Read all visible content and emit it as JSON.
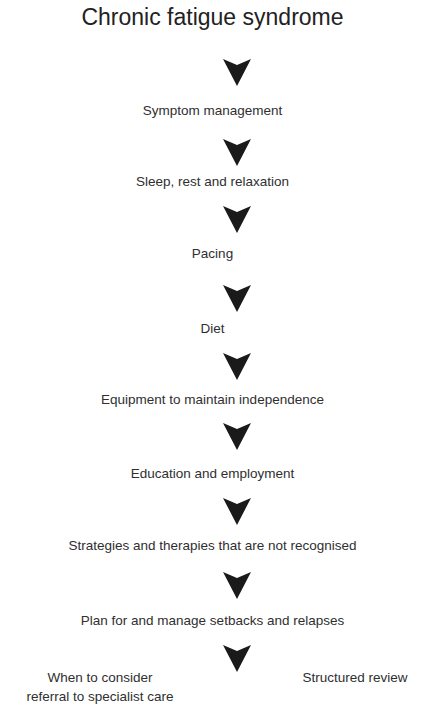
{
  "title": "Chronic fatigue syndrome",
  "steps": [
    "Symptom management",
    "Sleep, rest and relaxation",
    "Pacing",
    "Diet",
    "Equipment to maintain independence",
    "Education and employment",
    "Strategies and therapies that are not recognised",
    "Plan for and manage setbacks and relapses"
  ],
  "branches": {
    "left": [
      "When to consider",
      "referral to specialist care"
    ],
    "right": "Structured review"
  },
  "arrow_color": "#1a1a1a"
}
